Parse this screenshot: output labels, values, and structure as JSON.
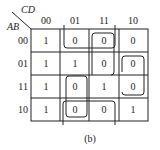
{
  "kmap": {
    "row_var": "AB",
    "col_var": "CD",
    "col_labels": [
      "00",
      "01",
      "11",
      "10"
    ],
    "row_labels": [
      "00",
      "01",
      "11",
      "10"
    ],
    "cells": [
      [
        "1",
        "0",
        "0",
        "0"
      ],
      [
        "1",
        "1",
        "0",
        "0"
      ],
      [
        "1",
        "0",
        "1",
        "0"
      ],
      [
        "1",
        "0",
        "0",
        "1"
      ]
    ],
    "groups": [
      {
        "name": "group-row0-cols-01-11",
        "description": "wraps row 00, columns 01-11, open to top"
      },
      {
        "name": "group-cols-11-col",
        "description": "column 11 rows 00-01 box"
      },
      {
        "name": "group-row1-col10",
        "description": "row 01 col 10, extends down to row 11"
      },
      {
        "name": "group-col01-row11-10",
        "description": "column 01 rows 11-10"
      },
      {
        "name": "group-row10-cols-01-11",
        "description": "row 10 columns 01-11, open to bottom"
      }
    ],
    "caption": "(b)"
  }
}
